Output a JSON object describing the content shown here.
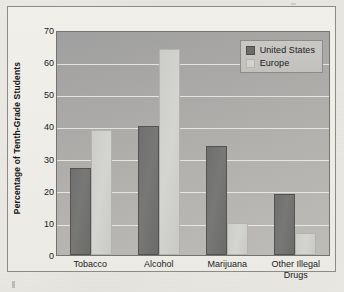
{
  "chart_data": {
    "type": "bar",
    "title": "",
    "subtitle": "",
    "xlabel": "",
    "ylabel": "Percentage of Tenth-Grade Students",
    "ylim": [
      0,
      70
    ],
    "ytick_step": 10,
    "yticks": [
      "70",
      "60",
      "50",
      "40",
      "30",
      "20",
      "10",
      "0"
    ],
    "grid": true,
    "legend_position": "top-right inside plot",
    "categories": [
      "Tobacco",
      "Alcohol",
      "Marijuana",
      "Other Illegal Drugs"
    ],
    "category_lines": [
      [
        "Tobacco"
      ],
      [
        "Alcohol"
      ],
      [
        "Marijuana"
      ],
      [
        "Other Illegal",
        "Drugs"
      ]
    ],
    "series": [
      {
        "name": "United States",
        "color": "#6f6f6f",
        "values": [
          27,
          40,
          34,
          19
        ]
      },
      {
        "name": "Europe",
        "color": "#d2d2ce",
        "values": [
          39,
          64,
          10,
          7
        ]
      }
    ]
  },
  "legend": {
    "items": [
      {
        "label": "United States"
      },
      {
        "label": "Europe"
      }
    ]
  },
  "colors": {
    "plot_background": "#aaa9a6",
    "gridline": "#f4f3f0",
    "frame_border": "#8e8b85",
    "page_background": "#e8e6e1",
    "series_us": "#6f6f6f",
    "series_eu": "#d2d2ce"
  }
}
